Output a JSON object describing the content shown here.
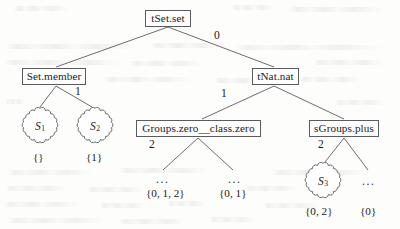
{
  "figure": {
    "kind": "tree-diagram",
    "width": 400,
    "height": 229,
    "line_color": "#5b5b5e",
    "text_color": "#1c1c1c",
    "background": "#fdfdfc"
  },
  "nodes": {
    "root": {
      "label": "tSet.set",
      "x": 145,
      "y": 10,
      "w": 46,
      "h": 17
    },
    "set_member": {
      "label": "Set.member",
      "x": 22,
      "y": 68,
      "w": 64,
      "h": 17
    },
    "tnat_nat": {
      "label": "tNat.nat",
      "x": 252,
      "y": 68,
      "w": 47,
      "h": 17
    },
    "groups_zero": {
      "label": "Groups.zero__class.zero",
      "x": 136,
      "y": 120,
      "w": 125,
      "h": 17
    },
    "sgroups_plus": {
      "label": "sGroups.plus",
      "x": 309,
      "y": 120,
      "w": 70,
      "h": 17
    }
  },
  "clouds": [
    {
      "name": "s1",
      "label": "S",
      "sub": "1",
      "cx": 40,
      "cy": 126,
      "r": 20
    },
    {
      "name": "s2",
      "label": "S",
      "sub": "2",
      "cx": 95,
      "cy": 126,
      "r": 20
    },
    {
      "name": "s3",
      "label": "S",
      "sub": "3",
      "cx": 323,
      "cy": 181,
      "r": 20
    }
  ],
  "edge_labels": [
    {
      "name": "root-to-tnat",
      "text": "0",
      "x": 214,
      "y": 30
    },
    {
      "name": "setmember-children",
      "text": "1",
      "x": 75,
      "y": 86
    },
    {
      "name": "tnat-to-groups",
      "text": "1",
      "x": 221,
      "y": 88
    },
    {
      "name": "groups-children",
      "text": "2",
      "x": 149,
      "y": 139
    },
    {
      "name": "sgroups-children",
      "text": "2",
      "x": 318,
      "y": 139
    }
  ],
  "leaf_labels": [
    {
      "name": "leaf-empty-set",
      "text": "{}",
      "x": 33,
      "y": 152
    },
    {
      "name": "leaf-one",
      "text": "{1}",
      "x": 86,
      "y": 152
    },
    {
      "name": "leaf-zero-one-two",
      "text": "{0, 1, 2}",
      "x": 146,
      "y": 188
    },
    {
      "name": "leaf-zero-one",
      "text": "{0, 1}",
      "x": 219,
      "y": 188
    },
    {
      "name": "leaf-zero-two",
      "text": "{0, 2}",
      "x": 305,
      "y": 206
    },
    {
      "name": "leaf-zero",
      "text": "{0}",
      "x": 360,
      "y": 206
    }
  ],
  "ellipses": [
    {
      "name": "ellipsis-groups-left",
      "text": "...",
      "x": 156,
      "y": 174
    },
    {
      "name": "ellipsis-groups-right",
      "text": "...",
      "x": 228,
      "y": 174
    },
    {
      "name": "ellipsis-sgroups-right",
      "text": "...",
      "x": 362,
      "y": 176
    }
  ],
  "edges": [
    {
      "from": "root",
      "to": "set_member",
      "x1": 168,
      "y1": 27,
      "x2": 56,
      "y2": 67
    },
    {
      "from": "root",
      "to": "tnat_nat",
      "x1": 168,
      "y1": 27,
      "x2": 274,
      "y2": 67
    },
    {
      "from": "set_member",
      "to": "s1",
      "x1": 56,
      "y1": 86,
      "x2": 40,
      "y2": 107
    },
    {
      "from": "set_member",
      "to": "s2",
      "x1": 56,
      "y1": 86,
      "x2": 92,
      "y2": 107
    },
    {
      "from": "tnat_nat",
      "to": "groups_zero",
      "x1": 274,
      "y1": 86,
      "x2": 202,
      "y2": 119
    },
    {
      "from": "tnat_nat",
      "to": "sgroups_plus",
      "x1": 274,
      "y1": 86,
      "x2": 344,
      "y2": 119
    },
    {
      "from": "groups_zero",
      "to": "ellipsis_left",
      "x1": 198,
      "y1": 138,
      "x2": 163,
      "y2": 170
    },
    {
      "from": "groups_zero",
      "to": "ellipsis_right",
      "x1": 198,
      "y1": 138,
      "x2": 233,
      "y2": 170
    },
    {
      "from": "sgroups_plus",
      "to": "s3",
      "x1": 344,
      "y1": 138,
      "x2": 325,
      "y2": 162
    },
    {
      "from": "sgroups_plus",
      "to": "ellipsis_right2",
      "x1": 344,
      "y1": 138,
      "x2": 368,
      "y2": 170
    }
  ]
}
